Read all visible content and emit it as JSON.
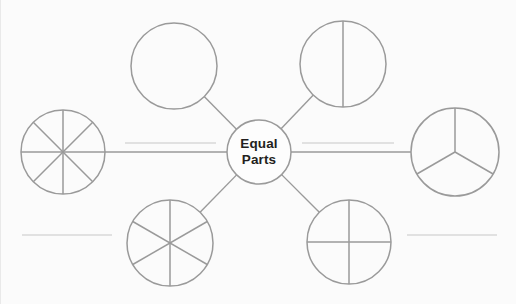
{
  "diagram": {
    "title": "Equal Parts",
    "background_color": "#fbfbfb",
    "stroke_color": "#9a9a9a",
    "faint_stroke_color": "#c8c8c8",
    "text_color": "#231f20",
    "width": 516,
    "height": 304,
    "hub": {
      "label_line1": "Equal",
      "label_line2": "Parts",
      "cx": 259,
      "cy": 152,
      "r": 32
    },
    "nodes": [
      {
        "id": "node-whole",
        "name": "whole-circle",
        "parts": 1,
        "parts_label": "1",
        "cx": 174,
        "cy": 66,
        "r": 43,
        "position": "top-left",
        "spoke": true
      },
      {
        "id": "node-halves",
        "name": "halves-circle",
        "parts": 2,
        "parts_label": "2",
        "cx": 343,
        "cy": 64,
        "r": 43,
        "position": "top-right",
        "spoke": true
      },
      {
        "id": "node-eighths",
        "name": "eighths-circle",
        "parts": 8,
        "parts_label": "8",
        "cx": 63,
        "cy": 152,
        "r": 42,
        "position": "left",
        "spoke": true
      },
      {
        "id": "node-thirds",
        "name": "thirds-circle",
        "parts": 3,
        "parts_label": "3",
        "cx": 455,
        "cy": 152,
        "r": 44,
        "position": "right",
        "spoke": true
      },
      {
        "id": "node-sixths",
        "name": "sixths-circle",
        "parts": 6,
        "parts_label": "6",
        "cx": 170,
        "cy": 243,
        "r": 43,
        "position": "bottom-left",
        "spoke": true
      },
      {
        "id": "node-quarters",
        "name": "quarters-circle",
        "parts": 4,
        "parts_label": "4",
        "cx": 349,
        "cy": 242,
        "r": 42,
        "position": "bottom-right",
        "spoke": true
      }
    ],
    "connectors": [
      {
        "id": "connector-left",
        "name": "left-connector-line",
        "x1": 105,
        "y1": 152,
        "x2": 227,
        "y2": 152
      },
      {
        "id": "connector-right",
        "name": "right-connector-line",
        "x1": 291,
        "y1": 152,
        "x2": 411,
        "y2": 152
      }
    ],
    "accent_lines": [
      {
        "id": "accent-left",
        "name": "left-accent-line",
        "x1": 125,
        "y1": 143,
        "x2": 216,
        "y2": 143
      },
      {
        "id": "accent-right",
        "name": "right-accent-line",
        "x1": 302,
        "y1": 143,
        "x2": 394,
        "y2": 143
      }
    ],
    "stub_lines": [
      {
        "id": "stub-bottom-left",
        "name": "bottom-left-stub-line",
        "x1": 22,
        "y1": 235,
        "x2": 112,
        "y2": 235
      },
      {
        "id": "stub-bottom-right",
        "name": "bottom-right-stub-line",
        "x1": 407,
        "y1": 235,
        "x2": 497,
        "y2": 235
      }
    ]
  }
}
